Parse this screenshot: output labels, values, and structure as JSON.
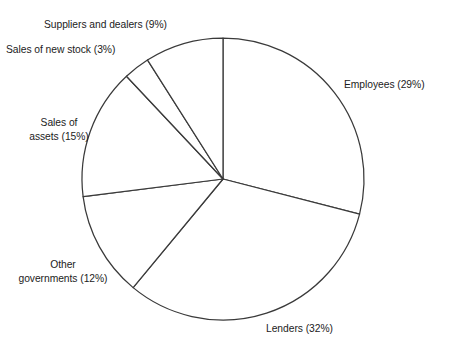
{
  "chart_data": {
    "type": "pie",
    "title": "",
    "categories": [
      "Employees",
      "Lenders",
      "Other governments",
      "Sales of assets",
      "Sales of new stock",
      "Suppliers and dealers"
    ],
    "values": [
      29,
      32,
      12,
      15,
      3,
      9
    ],
    "unit": "%",
    "total": 100,
    "start_angle_deg": 0,
    "direction": "clockwise",
    "legend": "none",
    "labels_position": "outside",
    "grid": false,
    "slice_fill": "#ffffff",
    "slice_stroke": "#3a3a3a",
    "labels": [
      {
        "key": "employees",
        "text": "Employees (29%)",
        "value": 29
      },
      {
        "key": "lenders",
        "text": "Lenders (32%)",
        "value": 32
      },
      {
        "key": "othergov",
        "text": "Other\ngovernments (12%)",
        "value": 12
      },
      {
        "key": "assets",
        "text": "Sales of\nassets (15%)",
        "value": 15
      },
      {
        "key": "newstock",
        "text": "Sales of new stock (3%)",
        "value": 3
      },
      {
        "key": "suppliers",
        "text": "Suppliers and dealers (9%)",
        "value": 9
      }
    ]
  },
  "figure": {
    "title": "",
    "background": "#ffffff",
    "geometry": {
      "cx": 223,
      "cy": 179,
      "r": 141
    }
  }
}
